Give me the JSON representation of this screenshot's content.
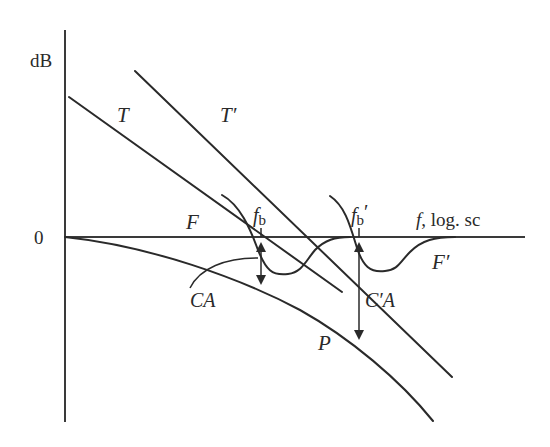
{
  "diagram": {
    "type": "frequency-response sketch (dB vs log frequency)",
    "axes": {
      "y_label": "dB",
      "zero_label": "0",
      "x_label": "f, log. sc"
    },
    "curves": {
      "T": "T",
      "T_prime": "T′",
      "F": "F",
      "F_prime": "F′",
      "P": "P"
    },
    "markers": {
      "fb": "f",
      "fb_sub": "b",
      "fb_prime": "f",
      "fb_prime_sub": "b",
      "fb_prime_mark": "′"
    },
    "annotations": {
      "CA": "CA",
      "C_prime_A": "C′A"
    },
    "colors": {
      "stroke": "#2a2a2a",
      "background": "#ffffff"
    }
  }
}
